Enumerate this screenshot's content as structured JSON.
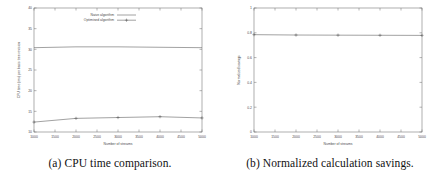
{
  "figure": {
    "subfigures": [
      {
        "id": "a",
        "caption": "(a) CPU time comparison.",
        "caption_label": "(a)",
        "caption_text": "CPU time comparison."
      },
      {
        "id": "b",
        "caption": "(b) Normalized calculation savings.",
        "caption_label": "(b)",
        "caption_text": "Normalized calculation savings."
      }
    ]
  },
  "chart_data": [
    {
      "type": "line",
      "id": "cpu-time-comparison",
      "title": "",
      "xlabel": "Number of streams",
      "ylabel": "CPU time (ms) per basis tree revision",
      "xlim": [
        1000,
        5000
      ],
      "ylim": [
        10,
        40
      ],
      "xticks": [
        1000,
        1500,
        2000,
        2500,
        3000,
        3500,
        4000,
        4500,
        5000
      ],
      "xticklabels": [
        "1000",
        "1500",
        "2000",
        "2500",
        "3000",
        "3500",
        "4000",
        "4500",
        "5000"
      ],
      "yticks": [
        10,
        15,
        20,
        25,
        30,
        35,
        40
      ],
      "yticklabels": [
        "10",
        "15",
        "20",
        "25",
        "30",
        "35",
        "40"
      ],
      "grid": false,
      "legend_position": "top-center",
      "x": [
        1000,
        2000,
        3000,
        4000,
        5000
      ],
      "series": [
        {
          "name": "Naive algorithm",
          "color": "#555555",
          "marker": "none",
          "values": [
            30.4,
            30.6,
            30.6,
            30.5,
            30.4
          ]
        },
        {
          "name": "Optimised algorithm",
          "color": "#555555",
          "marker": "plus",
          "values": [
            12.4,
            13.3,
            13.5,
            13.7,
            13.4
          ]
        }
      ]
    },
    {
      "type": "line",
      "id": "normalized-calculation-savings",
      "title": "",
      "xlabel": "Number of streams",
      "ylabel": "Normalized savings",
      "xlim": [
        1000,
        5000
      ],
      "ylim": [
        0,
        1
      ],
      "xticks": [
        1000,
        1500,
        2000,
        2500,
        3000,
        3500,
        4000,
        4500,
        5000
      ],
      "xticklabels": [
        "1000",
        "1500",
        "2000",
        "2500",
        "3000",
        "3500",
        "4000",
        "4500",
        "5000"
      ],
      "yticks": [
        0,
        0.2,
        0.4,
        0.6,
        0.8,
        1
      ],
      "yticklabels": [
        "0",
        "0.2",
        "0.4",
        "0.6",
        "0.8",
        "1"
      ],
      "grid": false,
      "legend_position": "none",
      "x": [
        1000,
        2000,
        3000,
        4000,
        5000
      ],
      "series": [
        {
          "name": "Normalized savings",
          "color": "#555555",
          "marker": "plus",
          "values": [
            0.785,
            0.782,
            0.781,
            0.78,
            0.779
          ]
        }
      ]
    }
  ]
}
